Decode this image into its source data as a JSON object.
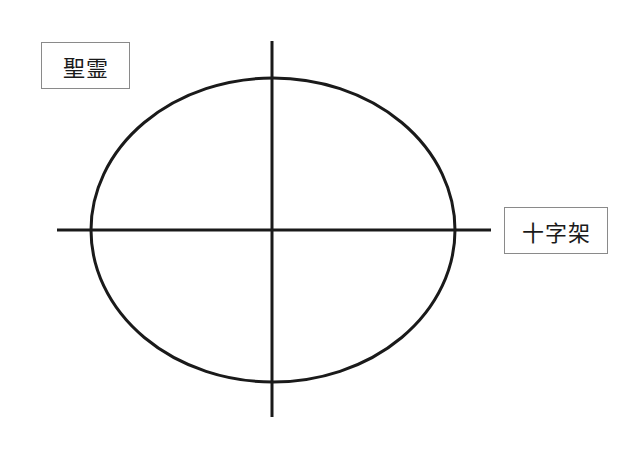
{
  "diagram": {
    "type": "ellipse-with-cross-axes",
    "stroke_color": "#1a1a1a",
    "label_border_color": "#8a8a8a",
    "ellipse": {
      "cx": 273,
      "cy": 230,
      "rx": 182,
      "ry": 152
    },
    "vertical_axis": {
      "x": 272,
      "y1": 41,
      "y2": 417
    },
    "horizontal_axis": {
      "y": 230,
      "x1": 57,
      "x2": 491
    },
    "labels": {
      "top_left": "聖霊",
      "right": "十字架"
    }
  }
}
